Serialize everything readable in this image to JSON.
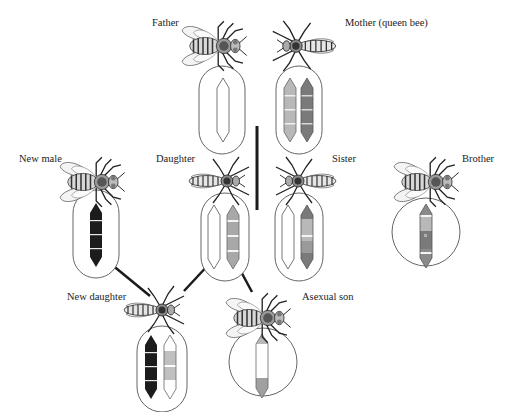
{
  "labels": {
    "father": "Father",
    "mother": "Mother (queen bee)",
    "new_male": "New male",
    "daughter": "Daughter",
    "sister": "Sister",
    "brother": "Brother",
    "new_daughter": "New daughter",
    "asexual_son": "Asexual son"
  },
  "colors": {
    "outline": "#555555",
    "connector": "#1a1a1a",
    "black_chrom": "#1c1c1c",
    "dark_grey": "#7a7a7a",
    "light_grey": "#b8b8b8",
    "mid_grey": "#9a9a9a",
    "white_chrom": "#ffffff"
  },
  "individuals": [
    {
      "id": "father",
      "label": "Father",
      "sex": "male",
      "container": "capsule",
      "chromosomes": [
        "white"
      ]
    },
    {
      "id": "mother",
      "label": "Mother (queen bee)",
      "sex": "female",
      "container": "capsule",
      "chromosomes": [
        "light-grey",
        "dark-grey"
      ]
    },
    {
      "id": "new_male",
      "label": "New male",
      "sex": "male",
      "container": "capsule",
      "chromosomes": [
        "black"
      ]
    },
    {
      "id": "daughter",
      "label": "Daughter",
      "sex": "female",
      "container": "capsule",
      "chromosomes": [
        "white",
        "mixed-grey"
      ]
    },
    {
      "id": "sister",
      "label": "Sister",
      "sex": "female",
      "container": "capsule",
      "chromosomes": [
        "white",
        "mixed-grey"
      ]
    },
    {
      "id": "brother",
      "label": "Brother",
      "sex": "male",
      "container": "circle",
      "chromosomes": [
        "mixed-grey"
      ]
    },
    {
      "id": "new_daughter",
      "label": "New daughter",
      "sex": "female",
      "container": "capsule",
      "chromosomes": [
        "black",
        "white-grey"
      ]
    },
    {
      "id": "asexual_son",
      "label": "Asexual son",
      "sex": "male",
      "container": "circle",
      "chromosomes": [
        "white-grey"
      ]
    }
  ]
}
